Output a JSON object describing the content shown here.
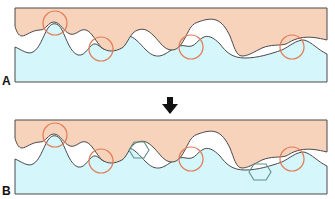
{
  "figure": {
    "panels": [
      {
        "id": "A",
        "label": "A",
        "contact_circles": 4,
        "wear_particles": 0
      },
      {
        "id": "B",
        "label": "B",
        "contact_circles": 4,
        "wear_particles": 2
      }
    ],
    "arrow": {
      "direction": "down",
      "meaning": "progression from A to B"
    },
    "colors": {
      "upper_surface": "#f8d3bb",
      "lower_surface": "#d5f6fb",
      "profile_line": "#4a4a4a",
      "contact_circle": "#e07a55",
      "wear_particle": "#5f8f86",
      "arrow": "#111111"
    }
  }
}
